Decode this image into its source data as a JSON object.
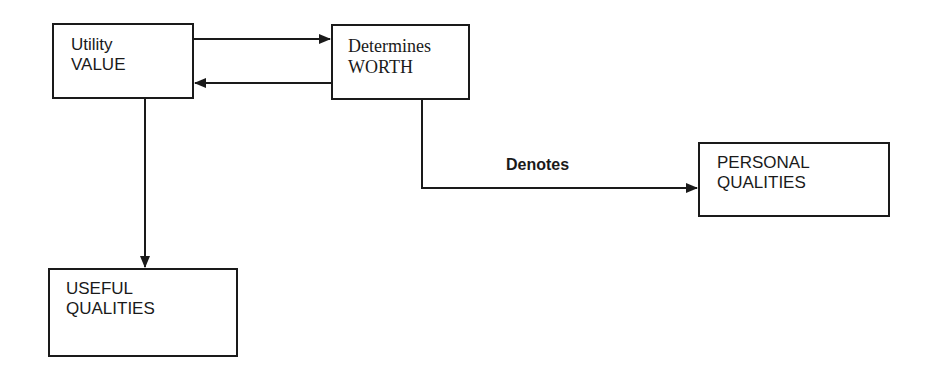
{
  "diagram": {
    "nodes": {
      "utility_value": {
        "line1": "Utility",
        "line2": "VALUE"
      },
      "determines_worth": {
        "line1": "Determines",
        "line2": "WORTH"
      },
      "personal_qualities": {
        "line1": "PERSONAL",
        "line2": "QUALITIES"
      },
      "useful_qualities": {
        "line1": "USEFUL",
        "line2": "QUALITIES"
      }
    },
    "edges": [
      {
        "from": "utility_value",
        "to": "determines_worth",
        "label": ""
      },
      {
        "from": "determines_worth",
        "to": "utility_value",
        "label": ""
      },
      {
        "from": "utility_value",
        "to": "useful_qualities",
        "label": ""
      },
      {
        "from": "determines_worth",
        "to": "personal_qualities",
        "label": "Denotes"
      }
    ],
    "denotes_label": "Denotes",
    "colors": {
      "line": "#1a1a1a",
      "background": "#ffffff"
    }
  }
}
